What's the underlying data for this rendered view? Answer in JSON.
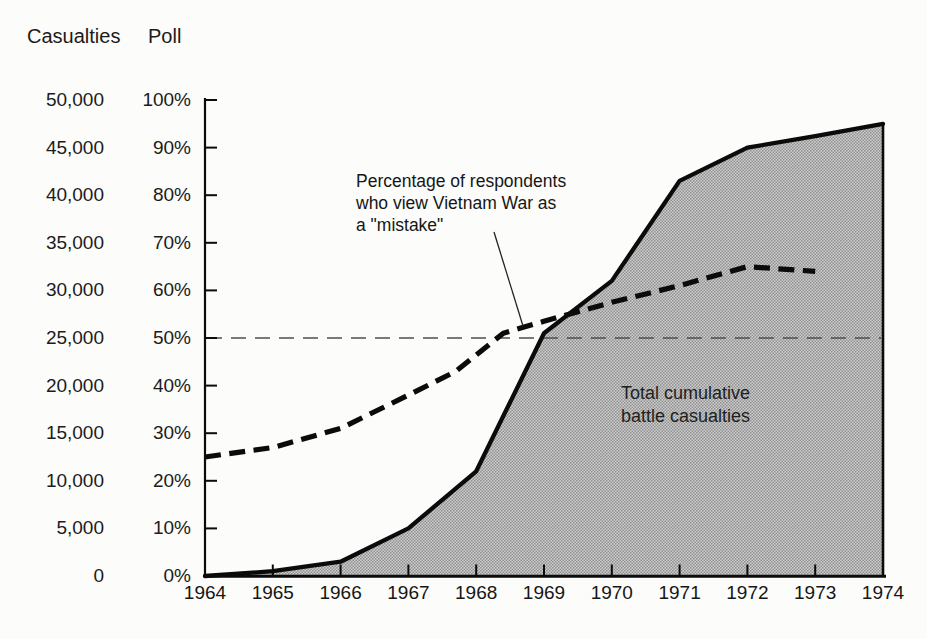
{
  "chart_data": {
    "type": "line",
    "title": "",
    "x_years": [
      1964,
      1965,
      1966,
      1967,
      1968,
      1969,
      1970,
      1971,
      1972,
      1973,
      1974
    ],
    "left_axis": {
      "title": "Casualties",
      "range": [
        0,
        50000
      ],
      "ticks": [
        "50,000",
        "45,000",
        "40,000",
        "35,000",
        "30,000",
        "25,000",
        "20,000",
        "15,000",
        "10,000",
        "5,000",
        "0"
      ]
    },
    "right_axis": {
      "title": "Poll",
      "range": [
        0,
        100
      ],
      "ticks": [
        "100%",
        "90%",
        "80%",
        "70%",
        "60%",
        "50%",
        "40%",
        "30%",
        "20%",
        "10%",
        "0%"
      ]
    },
    "x_ticklabels": [
      "1964",
      "1965",
      "1966",
      "1967",
      "1968",
      "1969",
      "1970",
      "1971",
      "1972",
      "1973",
      "1974"
    ],
    "series": [
      {
        "name": "Total cumulative battle casualties",
        "axis": "casualties",
        "style": "solid line with gray shaded area",
        "points": [
          [
            1964,
            0
          ],
          [
            1965,
            500
          ],
          [
            1966,
            1500
          ],
          [
            1967,
            5000
          ],
          [
            1968,
            11000
          ],
          [
            1969,
            25500
          ],
          [
            1970,
            31000
          ],
          [
            1971,
            41500
          ],
          [
            1972,
            45000
          ],
          [
            1973,
            46200
          ],
          [
            1974,
            47500
          ]
        ]
      },
      {
        "name": "Percentage of respondents who view Vietnam War as a \"mistake\"",
        "axis": "poll",
        "style": "thick dashed",
        "points": [
          [
            1964,
            25
          ],
          [
            1965,
            27
          ],
          [
            1966,
            31
          ],
          [
            1967,
            38
          ],
          [
            1967.7,
            43
          ],
          [
            1968.4,
            51
          ],
          [
            1969,
            53.5
          ],
          [
            1970,
            57.5
          ],
          [
            1971,
            61
          ],
          [
            1972,
            65
          ],
          [
            1973,
            64
          ]
        ]
      },
      {
        "name": "50% reference line",
        "axis": "poll",
        "style": "thin dashed",
        "points": [
          [
            1964,
            50
          ],
          [
            1974,
            50
          ]
        ]
      }
    ],
    "callout": {
      "lines": [
        "Percentage of respondents",
        "who view Vietnam War as",
        "a \"mistake\""
      ]
    },
    "area_label": {
      "lines": [
        "Total cumulative",
        "battle casualties"
      ]
    },
    "layout": {
      "legend": "none",
      "grid": "off",
      "x_range": [
        1964,
        1974
      ]
    },
    "colors": {
      "line": "#0b0b0b",
      "area_fill_average": "#b2b2b2",
      "reference_line": "#4f4f4f",
      "background": "#fcfcfa",
      "text": "#1a1a1a"
    }
  }
}
